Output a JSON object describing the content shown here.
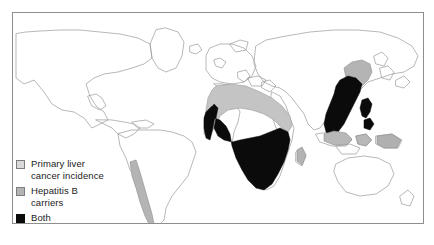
{
  "figure": {
    "frame_color": "#8e8e8e",
    "background": "#ffffff",
    "coastline_color": "#9a9a9a"
  },
  "legend": {
    "items": [
      {
        "label": "Primary liver\ncancer incidence",
        "swatch_name": "legend-swatch-liver-cancer",
        "color": "#d9d9d9",
        "border": "#7d7d7d"
      },
      {
        "label": "Hepatitis B\ncarriers",
        "swatch_name": "legend-swatch-hepatitis-b",
        "color": "#b4b4b4",
        "border": "#7d7d7d"
      },
      {
        "label": "Both",
        "swatch_name": "legend-swatch-both",
        "color": "#0b0b0b",
        "border": "#0b0b0b"
      }
    ]
  },
  "map_data": {
    "type": "choropleth",
    "projection": "world",
    "categories": [
      "Primary liver cancer incidence",
      "Hepatitis B carriers",
      "Both"
    ],
    "regions": [
      {
        "name": "Sub-Saharan Africa",
        "category": "Both",
        "fill": "#0b0b0b"
      },
      {
        "name": "West Africa coast",
        "category": "Both",
        "fill": "#0b0b0b"
      },
      {
        "name": "Madagascar",
        "category": "Hepatitis B carriers",
        "fill": "#b4b4b4"
      },
      {
        "name": "Sahel and North Africa band",
        "category": "Hepatitis B carriers",
        "fill": "#c0c0c0"
      },
      {
        "name": "Southern China and Southeast Asia",
        "category": "Both",
        "fill": "#0b0b0b"
      },
      {
        "name": "Philippines",
        "category": "Both",
        "fill": "#0b0b0b"
      },
      {
        "name": "Northern China and Korea",
        "category": "Hepatitis B carriers",
        "fill": "#b4b4b4"
      },
      {
        "name": "Indonesia and Malaysia",
        "category": "Hepatitis B carriers",
        "fill": "#b4b4b4"
      },
      {
        "name": "New Guinea",
        "category": "Hepatitis B carriers",
        "fill": "#b4b4b4"
      },
      {
        "name": "Andes and Chile",
        "category": "Hepatitis B carriers",
        "fill": "#b4b4b4"
      }
    ]
  }
}
